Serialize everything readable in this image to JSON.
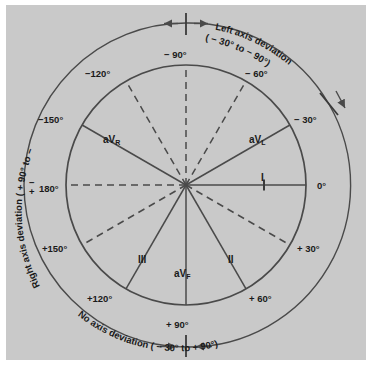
{
  "figure": {
    "background_color": "#c9c9c9",
    "line_color": "#4a4a4a",
    "text_color": "#1a1a1a"
  },
  "annotations": [
    {
      "name": "left-axis-deviation",
      "text": "Left axis deviation",
      "range": "( − 30° to  − 90°)",
      "position": "upper-right-arc"
    },
    {
      "name": "no-axis-deviation",
      "text": "No axis deviation",
      "range": "( − 30° to + 90°)",
      "position": "lower-right-arc"
    },
    {
      "name": "right-axis-deviation",
      "text": "Right axis deviation",
      "range": "( + 90° to  − 90°)",
      "position": "left-arc"
    }
  ],
  "angle_labels": [
    {
      "text": "0°",
      "angle": 0
    },
    {
      "text": "+ 30°",
      "angle": 30
    },
    {
      "text": "+ 60°",
      "angle": 60
    },
    {
      "text": "+ 90°",
      "angle": 90
    },
    {
      "text": "+120°",
      "angle": 120
    },
    {
      "text": "+150°",
      "angle": 150
    },
    {
      "text": "180°",
      "angle": 180,
      "prefix": "plusminus"
    },
    {
      "text": "−150°",
      "angle": -150
    },
    {
      "text": "−120°",
      "angle": -120
    },
    {
      "text": "− 90°",
      "angle": -90
    },
    {
      "text": "− 60°",
      "angle": -60
    },
    {
      "text": "− 30°",
      "angle": -30
    }
  ],
  "lead_labels": [
    {
      "name": "lead-avr",
      "base": "aV",
      "sub": "R",
      "angle": -150
    },
    {
      "name": "lead-avl",
      "base": "aV",
      "sub": "L",
      "angle": -30
    },
    {
      "name": "lead-avf",
      "base": "aV",
      "sub": "F",
      "angle": 90
    },
    {
      "name": "lead-one",
      "base": "I",
      "sub": "",
      "angle": 0
    },
    {
      "name": "lead-two",
      "base": "II",
      "sub": "",
      "angle": 60
    },
    {
      "name": "lead-three",
      "base": "III",
      "sub": "",
      "angle": 120
    }
  ],
  "spokes": [
    {
      "angle": 0,
      "style": "solid"
    },
    {
      "angle": 30,
      "style": "dashed"
    },
    {
      "angle": 60,
      "style": "solid"
    },
    {
      "angle": 90,
      "style": "solid"
    },
    {
      "angle": 120,
      "style": "solid"
    },
    {
      "angle": 150,
      "style": "dashed"
    },
    {
      "angle": 180,
      "style": "dashed"
    },
    {
      "angle": -150,
      "style": "solid"
    },
    {
      "angle": -120,
      "style": "dashed"
    },
    {
      "angle": -90,
      "style": "dashed"
    },
    {
      "angle": -60,
      "style": "dashed"
    },
    {
      "angle": -30,
      "style": "solid"
    }
  ]
}
